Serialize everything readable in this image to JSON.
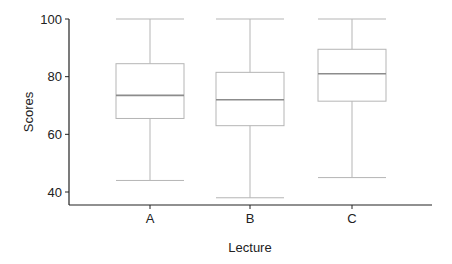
{
  "chart_data": {
    "type": "box",
    "title": "",
    "xlabel": "Lecture",
    "ylabel": "Scores",
    "categories": [
      "A",
      "B",
      "C"
    ],
    "ylim": [
      36,
      100
    ],
    "yticks": [
      40,
      60,
      80,
      100
    ],
    "grid": false,
    "legend": null,
    "series": [
      {
        "name": "A",
        "whisker_low": 44,
        "q1": 65.5,
        "median": 73.5,
        "q3": 84.5,
        "whisker_high": 100
      },
      {
        "name": "B",
        "whisker_low": 38,
        "q1": 63,
        "median": 72,
        "q3": 81.5,
        "whisker_high": 100
      },
      {
        "name": "C",
        "whisker_low": 45,
        "q1": 71.5,
        "median": 81,
        "q3": 89.5,
        "whisker_high": 100
      }
    ],
    "colors": {
      "box": "#b5b5b5",
      "median": "#8c8c8c",
      "axis": "#222222"
    }
  }
}
